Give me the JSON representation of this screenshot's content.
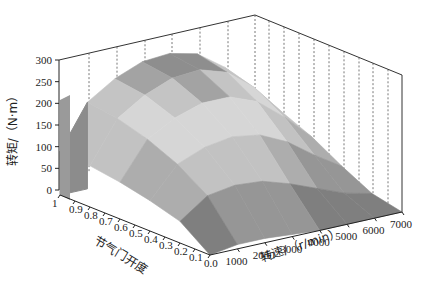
{
  "chart_data": {
    "type": "surface3d",
    "title": "",
    "xlabel": "转速/（r/min）",
    "ylabel": "节气门开度",
    "zlabel": "转矩/（N·m）",
    "x_ticks": [
      "1000",
      "2000",
      "3000",
      "4000",
      "5000",
      "6000",
      "7000"
    ],
    "y_ticks": [
      "1",
      "0.9",
      "0.8",
      "0.7",
      "0.6",
      "0.5",
      "0.4",
      "0.3",
      "0.2",
      "0.1",
      "0.0"
    ],
    "z_ticks": [
      "0",
      "50",
      "100",
      "150",
      "200",
      "250",
      "300"
    ],
    "xlim": [
      0,
      7000
    ],
    "ylim": [
      0,
      1
    ],
    "zlim": [
      0,
      300
    ],
    "grid": "dashed vertical lines on back wall",
    "colormap": "grayscale, banded contour levels",
    "x": [
      0,
      1000,
      2000,
      3000,
      4000,
      5000,
      6000,
      7000
    ],
    "y": [
      1.0,
      0.8,
      0.6,
      0.4,
      0.2,
      0.0
    ],
    "z": [
      [
        100,
        200,
        240,
        265,
        270,
        255,
        210,
        140
      ],
      [
        95,
        190,
        230,
        255,
        260,
        240,
        190,
        120
      ],
      [
        85,
        170,
        205,
        225,
        225,
        200,
        150,
        90
      ],
      [
        70,
        140,
        165,
        175,
        165,
        135,
        90,
        50
      ],
      [
        50,
        95,
        105,
        100,
        80,
        55,
        30,
        15
      ],
      [
        0,
        10,
        10,
        5,
        0,
        0,
        0,
        0
      ]
    ]
  },
  "axes": {
    "z_label": "转矩/（N·m）",
    "y_label": "节气门开度",
    "x_label": "转速/（r/min）"
  }
}
